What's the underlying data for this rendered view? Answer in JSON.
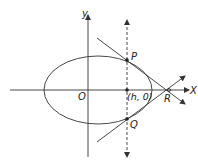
{
  "diagram": {
    "type": "ellipse-tangents",
    "colors": {
      "stroke": "#333333",
      "background": "#ffffff"
    },
    "axes": {
      "x_label": "X",
      "y_label": "y",
      "origin_label": "O"
    },
    "points": {
      "P": "P",
      "Q": "Q",
      "R": "R",
      "foot": "(h, 0)"
    },
    "lines": {
      "chord": "dashed vertical line x = h through P and Q",
      "tangent_P": "tangent at P through R",
      "tangent_Q": "tangent at Q through R"
    }
  }
}
